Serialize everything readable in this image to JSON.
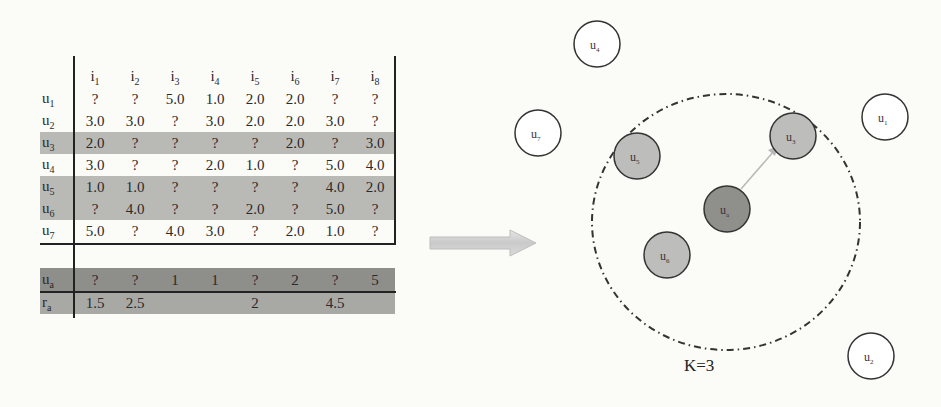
{
  "table": {
    "columns": [
      "i1",
      "i2",
      "i3",
      "i4",
      "i5",
      "i6",
      "i7",
      "i8"
    ],
    "rows": [
      {
        "label": "u1",
        "values": [
          "?",
          "?",
          "5.0",
          "1.0",
          "2.0",
          "2.0",
          "?",
          "?"
        ],
        "highlight": false
      },
      {
        "label": "u2",
        "values": [
          "3.0",
          "3.0",
          "?",
          "3.0",
          "2.0",
          "2.0",
          "3.0",
          "?"
        ],
        "highlight": false
      },
      {
        "label": "u3",
        "values": [
          "2.0",
          "?",
          "?",
          "?",
          "?",
          "2.0",
          "?",
          "3.0"
        ],
        "highlight": true
      },
      {
        "label": "u4",
        "values": [
          "3.0",
          "?",
          "?",
          "2.0",
          "1.0",
          "?",
          "5.0",
          "4.0"
        ],
        "highlight": false
      },
      {
        "label": "u5",
        "values": [
          "1.0",
          "1.0",
          "?",
          "?",
          "?",
          "?",
          "4.0",
          "2.0"
        ],
        "highlight": true
      },
      {
        "label": "u6",
        "values": [
          "?",
          "4.0",
          "?",
          "?",
          "2.0",
          "?",
          "5.0",
          "?"
        ],
        "highlight": true
      },
      {
        "label": "u7",
        "values": [
          "5.0",
          "?",
          "4.0",
          "3.0",
          "?",
          "2.0",
          "1.0",
          "?"
        ],
        "highlight": false
      }
    ],
    "target_row": {
      "label": "ua",
      "values": [
        "?",
        "?",
        "1",
        "1",
        "?",
        "2",
        "?",
        "5"
      ]
    },
    "prediction_row": {
      "label": "ra",
      "values": [
        "1.5",
        "2.5",
        "",
        "",
        "2",
        "",
        "4.5",
        ""
      ]
    }
  },
  "arrow": {
    "icon": "right-arrow-icon",
    "direction": "right"
  },
  "diagram": {
    "k_label": "K=3",
    "nodes": [
      {
        "id": "u4",
        "base": "u",
        "sub": "4",
        "type": "other"
      },
      {
        "id": "u7",
        "base": "u",
        "sub": "7",
        "type": "other"
      },
      {
        "id": "u1",
        "base": "u",
        "sub": "1",
        "type": "other"
      },
      {
        "id": "u2",
        "base": "u",
        "sub": "2",
        "type": "other"
      },
      {
        "id": "u5",
        "base": "u",
        "sub": "5",
        "type": "neighbor"
      },
      {
        "id": "u3",
        "base": "u",
        "sub": "3",
        "type": "neighbor"
      },
      {
        "id": "u6",
        "base": "u",
        "sub": "6",
        "type": "neighbor"
      },
      {
        "id": "ua",
        "base": "u",
        "sub": "a",
        "type": "target"
      }
    ],
    "colors": {
      "neighbor_fill": "#bdbdbb",
      "target_fill": "#8f8f8c",
      "other_fill": "#ffffff",
      "stroke": "#333333",
      "arrow_line": "#b8b8b8"
    }
  }
}
